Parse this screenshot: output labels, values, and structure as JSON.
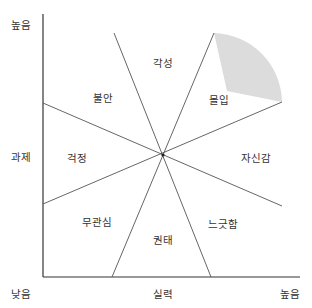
{
  "colors": {
    "axis": "#333333",
    "line": "#555555",
    "flow_fill": "#dcdcdc",
    "text": "#333333"
  },
  "axes": {
    "y": {
      "label": "과제",
      "high": "높음"
    },
    "x": {
      "label": "실력",
      "low": "낮음",
      "high": "높음"
    }
  },
  "regions": [
    {
      "id": "arousal",
      "label": "각성",
      "x": 163,
      "y": 63
    },
    {
      "id": "anxiety",
      "label": "불안",
      "x": 103,
      "y": 98
    },
    {
      "id": "flow",
      "label": "몰입",
      "x": 219,
      "y": 100
    },
    {
      "id": "worry",
      "label": "걱정",
      "x": 77,
      "y": 158
    },
    {
      "id": "control",
      "label": "자신감",
      "x": 256,
      "y": 158
    },
    {
      "id": "apathy",
      "label": "무관심",
      "x": 97,
      "y": 222
    },
    {
      "id": "relaxation",
      "label": "느긋함",
      "x": 223,
      "y": 224
    },
    {
      "id": "boredom",
      "label": "권태",
      "x": 163,
      "y": 240
    }
  ]
}
